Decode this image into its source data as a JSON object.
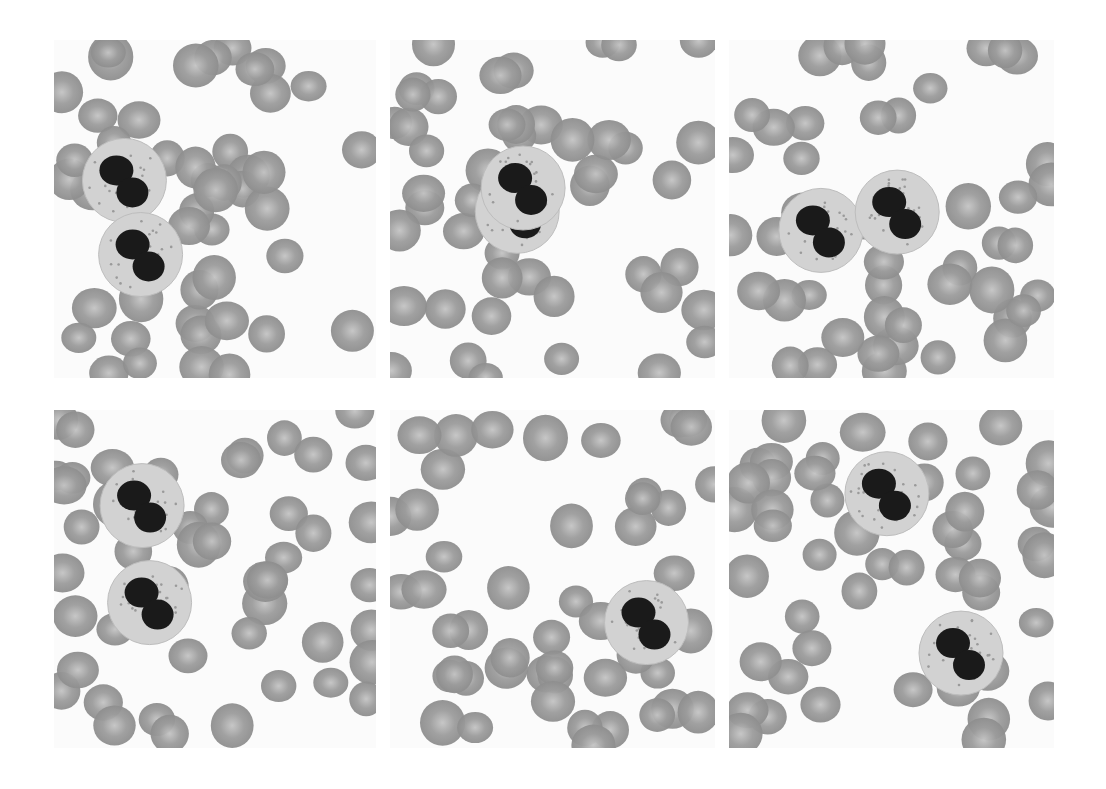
{
  "figure": {
    "layout": {
      "rows": 2,
      "cols": 3
    },
    "colors": {
      "background": "#ffffff",
      "rbc": "#9c9c9c",
      "rbc_center": "#c4c4c4",
      "cytoplasm": "#d2d2d2",
      "nucleus": "#1a1a1a"
    },
    "panels": [
      {
        "id": "p1",
        "x": 54,
        "y": 40,
        "w": 322,
        "h": 338,
        "cells": 2
      },
      {
        "id": "p2",
        "x": 390,
        "y": 40,
        "w": 325,
        "h": 338,
        "cells": 2
      },
      {
        "id": "p3",
        "x": 729,
        "y": 40,
        "w": 325,
        "h": 338,
        "cells": 2
      },
      {
        "id": "p4",
        "x": 54,
        "y": 410,
        "w": 322,
        "h": 338,
        "cells": 2
      },
      {
        "id": "p5",
        "x": 390,
        "y": 410,
        "w": 325,
        "h": 338,
        "cells": 1
      },
      {
        "id": "p6",
        "x": 729,
        "y": 410,
        "w": 325,
        "h": 338,
        "cells": 2
      }
    ]
  }
}
